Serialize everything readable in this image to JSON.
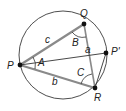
{
  "diagram": {
    "colors": {
      "circle": "#3a3a3a",
      "thick_side": "#8a8a8a",
      "thin_line": "#333333",
      "vertex": "#111111"
    },
    "circle": {
      "cx": 63,
      "cy": 55,
      "r": 44
    },
    "points": [
      {
        "id": "P",
        "label": "P",
        "x": 20,
        "y": 65,
        "lx": 7,
        "ly": 69
      },
      {
        "id": "Q",
        "label": "Q",
        "x": 84,
        "y": 24,
        "lx": 80,
        "ly": 17
      },
      {
        "id": "R",
        "label": "R",
        "x": 95,
        "y": 88,
        "lx": 94,
        "ly": 101
      },
      {
        "id": "P2",
        "label": "P'",
        "x": 106,
        "y": 53,
        "lx": 111,
        "ly": 55
      }
    ],
    "side_labels": [
      {
        "id": "c",
        "label": "c",
        "x": 45,
        "y": 43
      },
      {
        "id": "a",
        "label": "a",
        "x": 85,
        "y": 53
      },
      {
        "id": "b",
        "label": "b",
        "x": 52,
        "y": 85
      }
    ],
    "angle_labels": [
      {
        "id": "A",
        "label": "A",
        "x": 38,
        "y": 66
      },
      {
        "id": "B",
        "label": "B",
        "x": 72,
        "y": 46
      },
      {
        "id": "C",
        "label": "C",
        "x": 77,
        "y": 76
      }
    ]
  }
}
